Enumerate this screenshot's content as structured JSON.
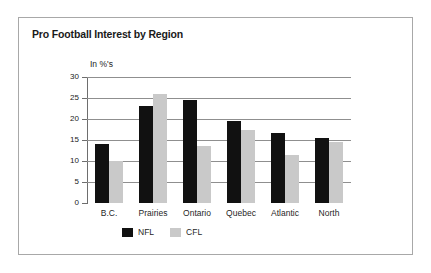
{
  "figure": {
    "title": "Pro Football Interest by Region",
    "border_color": "#a8a8a8",
    "background": "#ffffff"
  },
  "chart_data": {
    "type": "bar",
    "title": "Pro Football Interest by Region",
    "xlabel": "",
    "ylabel": "In %'s",
    "unit_label": "In %'s",
    "categories": [
      "B.C.",
      "Prairies",
      "Ontario",
      "Quebec",
      "Atlantic",
      "North"
    ],
    "series": [
      {
        "name": "NFL",
        "color": "#111111",
        "values": [
          14,
          23,
          24.5,
          19.5,
          16.7,
          15.5
        ]
      },
      {
        "name": "CFL",
        "color": "#c9c9c9",
        "values": [
          10,
          26,
          13.5,
          17.5,
          11.5,
          14.5
        ]
      }
    ],
    "ylim": [
      0,
      30
    ],
    "yticks": [
      0,
      5,
      10,
      15,
      20,
      25,
      30
    ],
    "ytick_labels": [
      "0",
      "5",
      "10",
      "15",
      "20",
      "25",
      "30"
    ],
    "grid": true,
    "grid_axis": "y",
    "legend_position": "bottom-left",
    "legend": [
      "NFL",
      "CFL"
    ]
  }
}
